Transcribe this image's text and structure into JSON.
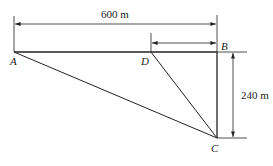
{
  "diagram": {
    "points": {
      "A": {
        "label": "A"
      },
      "B": {
        "label": "B"
      },
      "C": {
        "label": "C"
      },
      "D": {
        "label": "D"
      }
    },
    "dimensions": {
      "AB": {
        "label": "600 m"
      },
      "BC": {
        "label": "240 m"
      },
      "DB": {
        "label": ""
      }
    },
    "colors": {
      "line": "#222222",
      "background": "#ffffff"
    }
  }
}
